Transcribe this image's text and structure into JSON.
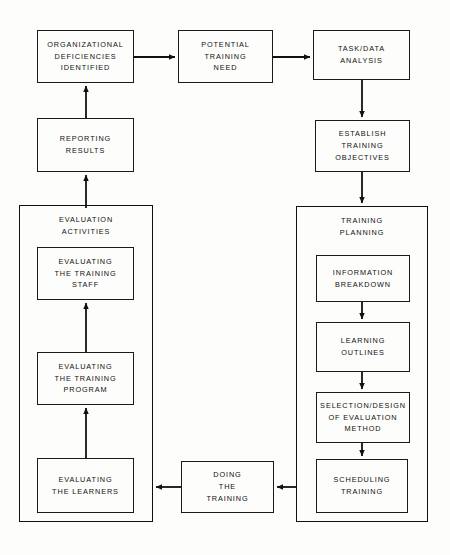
{
  "diagram": {
    "type": "flowchart",
    "stroke_color": "#111111",
    "background_color": "#fdfdfb"
  },
  "groups": [
    {
      "id": "evaluation-activities",
      "title": "EVALUATION\nACTIVITIES",
      "x": 19,
      "y": 205,
      "w": 134,
      "h": 317
    },
    {
      "id": "training-planning",
      "title": "TRAINING\nPLANNING",
      "x": 296,
      "y": 206,
      "w": 132,
      "h": 316
    }
  ],
  "nodes": [
    {
      "id": "organizational-deficiencies-identified",
      "label": "ORGANIZATIONAL\nDEFICIENCIES\nIDENTIFIED",
      "x": 37,
      "y": 30,
      "w": 97,
      "h": 53
    },
    {
      "id": "potential-training-need",
      "label": "POTENTIAL\nTRAINING\nNEED",
      "x": 178,
      "y": 30,
      "w": 95,
      "h": 53
    },
    {
      "id": "task-data-analysis",
      "label": "TASK/DATA\nANALYSIS",
      "x": 313,
      "y": 30,
      "w": 97,
      "h": 50
    },
    {
      "id": "establish-training-objectives",
      "label": "ESTABLISH\nTRAINING\nOBJECTIVES",
      "x": 315,
      "y": 120,
      "w": 95,
      "h": 52
    },
    {
      "id": "reporting-results",
      "label": "REPORTING\nRESULTS",
      "x": 37,
      "y": 118,
      "w": 97,
      "h": 54
    },
    {
      "id": "evaluating-the-training-staff",
      "label": "EVALUATING\nTHE TRAINING\nSTAFF",
      "x": 37,
      "y": 247,
      "w": 97,
      "h": 53
    },
    {
      "id": "evaluating-the-training-program",
      "label": "EVALUATING\nTHE TRAINING\nPROGRAM",
      "x": 37,
      "y": 352,
      "w": 97,
      "h": 53
    },
    {
      "id": "evaluating-the-learners",
      "label": "EVALUATING\nTHE LEARNERS",
      "x": 37,
      "y": 458,
      "w": 97,
      "h": 55
    },
    {
      "id": "doing-the-training",
      "label": "DOING\nTHE\nTRAINING",
      "x": 181,
      "y": 461,
      "w": 93,
      "h": 52
    },
    {
      "id": "information-breakdown",
      "label": "INFORMATION\nBREAKDOWN",
      "x": 316,
      "y": 255,
      "w": 94,
      "h": 47
    },
    {
      "id": "learning-outlines",
      "label": "LEARNING\nOUTLINES",
      "x": 316,
      "y": 322,
      "w": 94,
      "h": 50
    },
    {
      "id": "selection-design-of-evaluation-method",
      "label": "SELECTION/DESIGN\nOF EVALUATION\nMETHOD",
      "x": 316,
      "y": 392,
      "w": 94,
      "h": 51
    },
    {
      "id": "scheduling-training",
      "label": "SCHEDULING\nTRAINING",
      "x": 316,
      "y": 459,
      "w": 92,
      "h": 54
    }
  ],
  "edges": [
    {
      "id": "edge-deficiencies-to-potential-need",
      "from": "organizational-deficiencies-identified",
      "to": "potential-training-need",
      "direction": "right"
    },
    {
      "id": "edge-potential-need-to-task-data",
      "from": "potential-training-need",
      "to": "task-data-analysis",
      "direction": "right"
    },
    {
      "id": "edge-task-data-to-establish-objectives",
      "from": "task-data-analysis",
      "to": "establish-training-objectives",
      "direction": "down"
    },
    {
      "id": "edge-establish-objectives-to-training-planning",
      "from": "establish-training-objectives",
      "to": "training-planning",
      "direction": "down"
    },
    {
      "id": "edge-information-breakdown-to-learning-outlines",
      "from": "information-breakdown",
      "to": "learning-outlines",
      "direction": "down"
    },
    {
      "id": "edge-learning-outlines-to-selection-design",
      "from": "learning-outlines",
      "to": "selection-design-of-evaluation-method",
      "direction": "down"
    },
    {
      "id": "edge-selection-design-to-scheduling",
      "from": "selection-design-of-evaluation-method",
      "to": "scheduling-training",
      "direction": "down"
    },
    {
      "id": "edge-training-planning-to-doing-the-training",
      "from": "training-planning",
      "to": "doing-the-training",
      "direction": "left"
    },
    {
      "id": "edge-doing-the-training-to-evaluation-activities",
      "from": "doing-the-training",
      "to": "evaluation-activities",
      "direction": "left"
    },
    {
      "id": "edge-learners-to-program",
      "from": "evaluating-the-learners",
      "to": "evaluating-the-training-program",
      "direction": "up"
    },
    {
      "id": "edge-program-to-staff",
      "from": "evaluating-the-training-program",
      "to": "evaluating-the-training-staff",
      "direction": "up"
    },
    {
      "id": "edge-evaluation-activities-to-reporting-results",
      "from": "evaluation-activities",
      "to": "reporting-results",
      "direction": "up"
    },
    {
      "id": "edge-reporting-results-to-deficiencies",
      "from": "reporting-results",
      "to": "organizational-deficiencies-identified",
      "direction": "up"
    }
  ]
}
